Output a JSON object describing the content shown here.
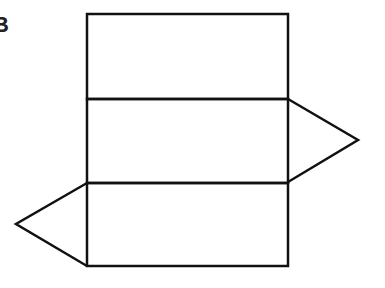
{
  "figure": {
    "label": "B",
    "stroke_color": "#111111",
    "rectangles": [
      {
        "x": 87,
        "y": 14,
        "w": 201,
        "h": 85
      },
      {
        "x": 87,
        "y": 99,
        "w": 201,
        "h": 84
      },
      {
        "x": 87,
        "y": 183,
        "w": 201,
        "h": 83
      }
    ],
    "triangles": [
      {
        "points": "288,99 358,140 288,182"
      },
      {
        "points": "87,183 16,224 87,266"
      }
    ]
  }
}
